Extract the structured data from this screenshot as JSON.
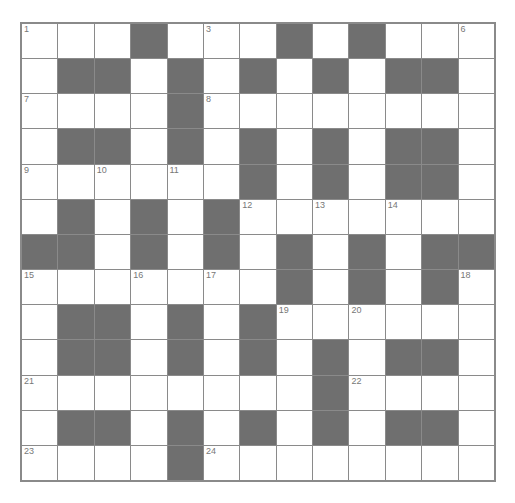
{
  "puzzle": {
    "rows": 13,
    "cols": 13,
    "colors": {
      "block": "#6f6f6f",
      "cell": "#ffffff",
      "line": "#8a8a8a",
      "number": "#777777"
    },
    "layout": [
      "...#...#.#...",
      ".##.#.#.#.##.",
      "....#........",
      ".##.#.#.#.##.",
      "......#.#.##.",
      ".#.#.#.......",
      "##.#.#.#.#.##",
      ".......#.#.#.",
      ".##.#.#......",
      ".##.#.#.#.##.",
      "........#....",
      ".##.#.#.#.##.",
      "....#........"
    ],
    "numbers": [
      {
        "r": 0,
        "c": 0,
        "n": "1"
      },
      {
        "r": 0,
        "c": 3,
        "n": "2"
      },
      {
        "r": 0,
        "c": 5,
        "n": "3"
      },
      {
        "r": 0,
        "c": 7,
        "n": "4"
      },
      {
        "r": 0,
        "c": 9,
        "n": "5"
      },
      {
        "r": 0,
        "c": 12,
        "n": "6"
      },
      {
        "r": 2,
        "c": 0,
        "n": "7"
      },
      {
        "r": 2,
        "c": 5,
        "n": "8"
      },
      {
        "r": 4,
        "c": 0,
        "n": "9"
      },
      {
        "r": 4,
        "c": 2,
        "n": "10"
      },
      {
        "r": 4,
        "c": 4,
        "n": "11"
      },
      {
        "r": 5,
        "c": 6,
        "n": "12"
      },
      {
        "r": 5,
        "c": 8,
        "n": "13"
      },
      {
        "r": 5,
        "c": 10,
        "n": "14"
      },
      {
        "r": 7,
        "c": 0,
        "n": "15"
      },
      {
        "r": 7,
        "c": 3,
        "n": "16"
      },
      {
        "r": 7,
        "c": 5,
        "n": "17"
      },
      {
        "r": 7,
        "c": 12,
        "n": "18"
      },
      {
        "r": 8,
        "c": 7,
        "n": "19"
      },
      {
        "r": 8,
        "c": 9,
        "n": "20"
      },
      {
        "r": 10,
        "c": 0,
        "n": "21"
      },
      {
        "r": 10,
        "c": 9,
        "n": "22"
      },
      {
        "r": 12,
        "c": 0,
        "n": "23"
      },
      {
        "r": 12,
        "c": 5,
        "n": "24"
      }
    ]
  }
}
